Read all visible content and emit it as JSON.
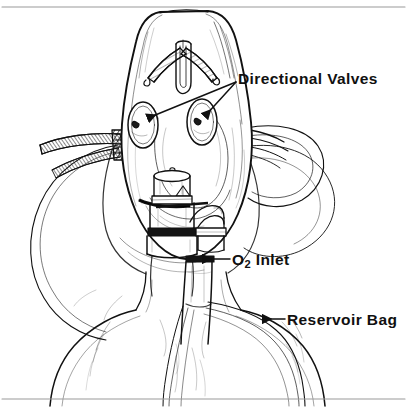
{
  "figure": {
    "background_color": "#ffffff",
    "ink_color": "#111111",
    "width": 407,
    "height": 410,
    "borders": {
      "top_rule": true,
      "bottom_rule": true,
      "side_rules": false,
      "rule_color": "#9a9a9a"
    }
  },
  "labels": {
    "directional_valves": {
      "text": "Directional Valves",
      "leader": "two-branch-arrow",
      "points_to": "valve-disc-left, valve-disc-right"
    },
    "o2_inlet": {
      "text_prefix": "O",
      "text_subscript": "2",
      "text_suffix": " Inlet",
      "full_text": "O2 Inlet",
      "leader": "single-arrow-left",
      "points_to": "o2-inlet-port"
    },
    "reservoir_bag": {
      "text": "Reservoir Bag",
      "leader": "single-arrow-left",
      "points_to": "reservoir-bag"
    }
  },
  "parts": [
    {
      "id": "mask-body",
      "name": "Face mask shell"
    },
    {
      "id": "nose-clip",
      "name": "Adjustable nose clip"
    },
    {
      "id": "valve-disc-left",
      "name": "Directional valve (left)"
    },
    {
      "id": "valve-disc-right",
      "name": "Directional valve (right)"
    },
    {
      "id": "strap-left",
      "name": "Elastic head strap (left)"
    },
    {
      "id": "strap-right",
      "name": "Elastic head strap (right)"
    },
    {
      "id": "connector-assembly",
      "name": "Mask connector / tubing"
    },
    {
      "id": "o2-inlet-port",
      "name": "Oxygen inlet port"
    },
    {
      "id": "reservoir-bag",
      "name": "Reservoir bag"
    },
    {
      "id": "patient-body",
      "name": "Patient head, neck and shoulders"
    }
  ]
}
